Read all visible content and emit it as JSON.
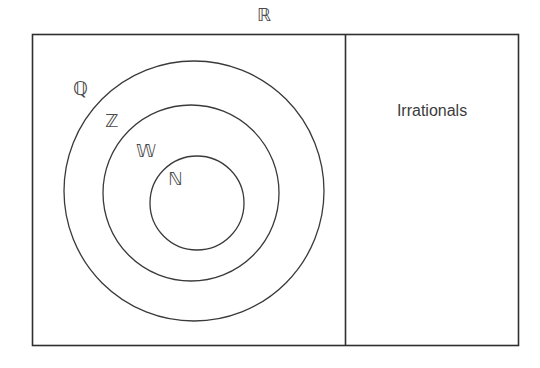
{
  "diagram": {
    "title_symbol": "ℝ",
    "type": "nested-set-venn-diagram",
    "universe_label": "ℝ",
    "outer_rectangle": {
      "x": 32,
      "y": 34,
      "width": 486,
      "height": 311,
      "stroke": "#2f2f2f"
    },
    "divider": {
      "x": 345,
      "stroke": "#2f2f2f"
    },
    "circles": [
      {
        "label": "ℚ",
        "name": "rationals",
        "cx": 194,
        "cy": 191,
        "r": 130,
        "stroke": "#3a3a3a"
      },
      {
        "label": "ℤ",
        "name": "integers",
        "cx": 191,
        "cy": 193,
        "r": 88,
        "stroke": "#3a3a3a"
      },
      {
        "label": "𝕎",
        "name": "whole-numbers",
        "cx": 197,
        "cy": 203,
        "r": 47,
        "stroke": "#3a3a3a"
      }
    ],
    "labels": [
      {
        "key": "R",
        "text": "ℝ"
      },
      {
        "key": "Q",
        "text": "ℚ"
      },
      {
        "key": "Z",
        "text": "ℤ"
      },
      {
        "key": "W",
        "text": "𝕎"
      },
      {
        "key": "N",
        "text": "ℕ"
      },
      {
        "key": "irrationals",
        "text": "Irrationals"
      }
    ],
    "right_region": {
      "label": "Irrationals"
    },
    "colors": {
      "background": "#ffffff",
      "stroke": "#2f2f2f",
      "circle_stroke": "#3a3a3a",
      "text": "#3a3a3a"
    }
  }
}
